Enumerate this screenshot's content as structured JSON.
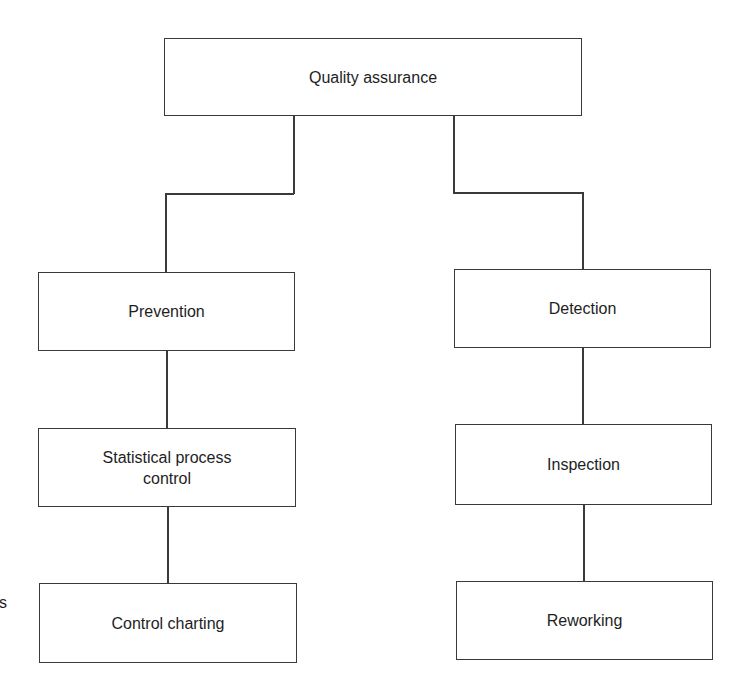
{
  "diagram": {
    "root": {
      "label": "Quality assurance"
    },
    "left_branch": {
      "nodes": [
        {
          "label": "Prevention"
        },
        {
          "label": "Statistical process control"
        },
        {
          "label": "Control charting"
        }
      ]
    },
    "right_branch": {
      "nodes": [
        {
          "label": "Detection"
        },
        {
          "label": "Inspection"
        },
        {
          "label": "Reworking"
        }
      ]
    },
    "edge_fragment": "s"
  }
}
